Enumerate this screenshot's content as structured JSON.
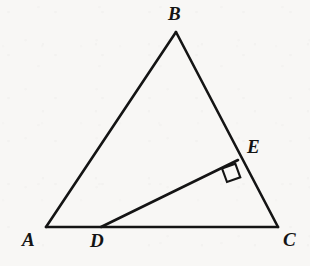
{
  "figure": {
    "kind": "euclidean-geometry-diagram",
    "background_color": "#f8f7f5",
    "stroke_color": "#141414",
    "stroke_width": 2.6,
    "width": 310,
    "height": 266
  },
  "points": {
    "A": {
      "label": "A",
      "x": 46,
      "y": 227,
      "label_x": 22,
      "label_y": 230
    },
    "B": {
      "label": "B",
      "x": 176,
      "y": 32,
      "label_x": 168,
      "label_y": 4
    },
    "C": {
      "label": "C",
      "x": 278,
      "y": 227,
      "label_x": 283,
      "label_y": 230
    },
    "D": {
      "label": "D",
      "x": 101,
      "y": 227,
      "label_x": 90,
      "label_y": 231
    },
    "E": {
      "label": "E",
      "x": 238,
      "y": 160,
      "label_x": 247,
      "label_y": 137
    }
  },
  "segments": [
    {
      "name": "AB",
      "from": "A",
      "to": "B"
    },
    {
      "name": "BC",
      "from": "B",
      "to": "C"
    },
    {
      "name": "AC",
      "from": "A",
      "to": "C"
    },
    {
      "name": "DE",
      "from": "D",
      "to": "E"
    }
  ],
  "right_angle_marker": {
    "at": "E",
    "between": [
      "DE",
      "EC"
    ],
    "size": 15,
    "points": "235.3,163.7 222.0,168.4 227.0,182.0 240.3,177.3"
  }
}
